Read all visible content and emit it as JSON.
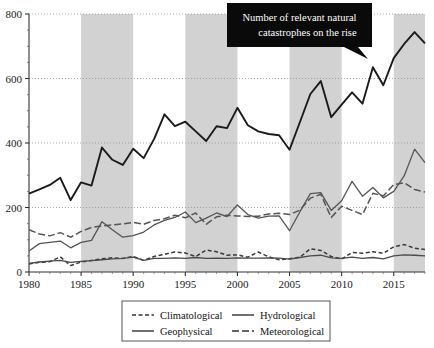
{
  "chart_data": {
    "type": "line",
    "title": "",
    "annotation": {
      "line1": "Number of relevant natural",
      "line2": "catastrophes on the rise"
    },
    "xlabel": "",
    "ylabel": "",
    "xlim": [
      1980,
      2018
    ],
    "ylim": [
      0,
      800
    ],
    "xticks": [
      "1980",
      "1985",
      "1990",
      "1995",
      "2000",
      "2005",
      "2010",
      "2015"
    ],
    "xtick_values": [
      1980,
      1985,
      1990,
      1995,
      2000,
      2005,
      2010,
      2015
    ],
    "yticks": [
      "0",
      "200",
      "400",
      "600",
      "800"
    ],
    "ytick_values": [
      0,
      200,
      400,
      600,
      800
    ],
    "grid": "dotted-horizontal",
    "legend_position": "below-center",
    "shaded_bands": [
      [
        1985,
        1990
      ],
      [
        1995,
        2000
      ],
      [
        2005,
        2010
      ],
      [
        2015,
        2018
      ]
    ],
    "band_color": "#d2d2d2",
    "x": [
      1980,
      1981,
      1982,
      1983,
      1984,
      1985,
      1986,
      1987,
      1988,
      1989,
      1990,
      1991,
      1992,
      1993,
      1994,
      1995,
      1996,
      1997,
      1998,
      1999,
      2000,
      2001,
      2002,
      2003,
      2004,
      2005,
      2006,
      2007,
      2008,
      2009,
      2010,
      2011,
      2012,
      2013,
      2014,
      2015,
      2016,
      2017,
      2018
    ],
    "series": [
      {
        "name": "Geophysical",
        "style": "solid",
        "color": "#1a1a1a",
        "width": 1.9,
        "values": [
          243,
          256,
          270,
          292,
          223,
          278,
          268,
          386,
          348,
          332,
          382,
          353,
          412,
          489,
          452,
          466,
          436,
          406,
          452,
          446,
          509,
          455,
          436,
          428,
          424,
          379,
          465,
          552,
          592,
          480,
          519,
          557,
          522,
          635,
          579,
          663,
          707,
          744,
          709
        ]
      },
      {
        "name": "Hydrological",
        "style": "solid",
        "color": "#555555",
        "width": 1.3,
        "values": [
          65,
          88,
          92,
          96,
          75,
          92,
          98,
          156,
          131,
          108,
          113,
          124,
          146,
          160,
          169,
          186,
          153,
          167,
          183,
          172,
          208,
          178,
          167,
          173,
          174,
          128,
          187,
          243,
          246,
          191,
          221,
          281,
          235,
          262,
          230,
          250,
          298,
          381,
          339
        ]
      },
      {
        "name": "Meteorological",
        "style": "long-dash",
        "color": "#555555",
        "width": 1.5,
        "values": [
          131,
          118,
          112,
          122,
          108,
          126,
          138,
          143,
          146,
          149,
          154,
          148,
          160,
          165,
          176,
          168,
          183,
          148,
          171,
          176,
          174,
          172,
          173,
          180,
          182,
          178,
          192,
          229,
          241,
          169,
          204,
          191,
          178,
          244,
          236,
          271,
          277,
          256,
          248
        ]
      },
      {
        "name": "Climatological",
        "style": "dash",
        "color": "#3a3a3a",
        "width": 1.5,
        "values": [
          25,
          30,
          32,
          47,
          20,
          31,
          36,
          41,
          44,
          42,
          48,
          36,
          48,
          55,
          62,
          59,
          48,
          68,
          63,
          52,
          53,
          46,
          62,
          47,
          38,
          41,
          46,
          72,
          67,
          48,
          40,
          61,
          58,
          63,
          58,
          78,
          85,
          74,
          70
        ]
      },
      {
        "name": "Geophysical-lower",
        "style": "solid-thin",
        "color": "#4a4a4a",
        "width": 1.3,
        "values": [
          27,
          31,
          34,
          36,
          30,
          33,
          35,
          38,
          41,
          42,
          46,
          36,
          42,
          42,
          44,
          42,
          45,
          42,
          43,
          42,
          44,
          43,
          43,
          44,
          43,
          40,
          45,
          50,
          52,
          44,
          42,
          46,
          42,
          45,
          41,
          50,
          53,
          52,
          50
        ]
      }
    ],
    "legend": [
      {
        "label": "Climatological",
        "style": "dash"
      },
      {
        "label": "Hydrological",
        "style": "solid"
      },
      {
        "label": "Geophysical",
        "style": "solid"
      },
      {
        "label": "Meteorological",
        "style": "long-dash"
      }
    ]
  }
}
